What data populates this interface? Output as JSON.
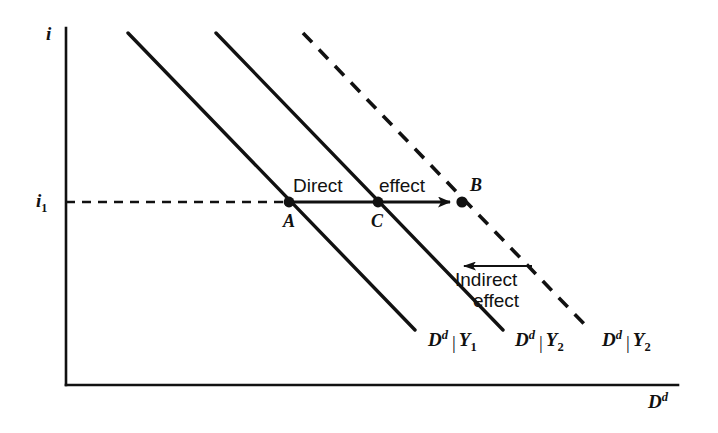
{
  "figure": {
    "background": "#ffffff",
    "ink": "#111111",
    "type": "economics-line-diagram"
  },
  "axes": {
    "y_label": "i",
    "x_label_base": "D",
    "x_label_sup": "d",
    "origin": {
      "x": 66,
      "y": 385
    },
    "y_top": {
      "x": 66,
      "y": 28
    },
    "x_right": {
      "x": 678,
      "y": 385
    }
  },
  "ticks": {
    "y": [
      {
        "label_base": "i",
        "label_sub": "1",
        "value_y": 202
      }
    ]
  },
  "guide_line": {
    "name": "i1-dashed-guide",
    "from_x": 66,
    "to_x": 289,
    "y": 202,
    "style": "dashed"
  },
  "curves": [
    {
      "id": "curve-1",
      "label_base": "D",
      "label_sup": "d",
      "label_bar": "|",
      "label_sub_base": "Y",
      "label_sub": "1",
      "style": "solid",
      "x1": 128,
      "y1": 33,
      "x2": 415,
      "y2": 330,
      "label_x": 428,
      "label_y": 332
    },
    {
      "id": "curve-2",
      "label_base": "D",
      "label_sup": "d",
      "label_bar": "|",
      "label_sub_base": "Y",
      "label_sub": "2",
      "style": "solid",
      "x1": 216,
      "y1": 33,
      "x2": 503,
      "y2": 330,
      "label_x": 515,
      "label_y": 332
    },
    {
      "id": "curve-3",
      "label_base": "D",
      "label_sup": "d",
      "label_bar": "|",
      "label_sub_base": "Y",
      "label_sub": "2",
      "style": "dashed",
      "x1": 303,
      "y1": 33,
      "x2": 590,
      "y2": 330,
      "label_x": 602,
      "label_y": 332
    }
  ],
  "points": [
    {
      "id": "A",
      "label": "A",
      "x": 289,
      "y": 202,
      "label_x": 283,
      "label_y": 212
    },
    {
      "id": "C",
      "label": "C",
      "x": 378,
      "y": 202,
      "label_x": 371,
      "label_y": 212
    },
    {
      "id": "B",
      "label": "B",
      "x": 462,
      "y": 202,
      "label_x": 470,
      "label_y": 176
    }
  ],
  "annotations": [
    {
      "id": "direct-effect",
      "word1": "Direct",
      "word2": "effect",
      "word1_x": 293,
      "word1_y": 176,
      "word2_x": 379,
      "word2_y": 176,
      "arrow": {
        "from_x": 289,
        "from_y": 202,
        "to_x": 462,
        "to_y": 202,
        "direction": "right"
      }
    },
    {
      "id": "indirect-effect",
      "word1": "Indirect",
      "word2": "effect",
      "word1_x": 455,
      "word1_y": 270,
      "word2_x": 473,
      "word2_y": 291,
      "arrow": {
        "from_x": 532,
        "from_y": 266,
        "to_x": 452,
        "to_y": 266,
        "direction": "left"
      }
    }
  ]
}
